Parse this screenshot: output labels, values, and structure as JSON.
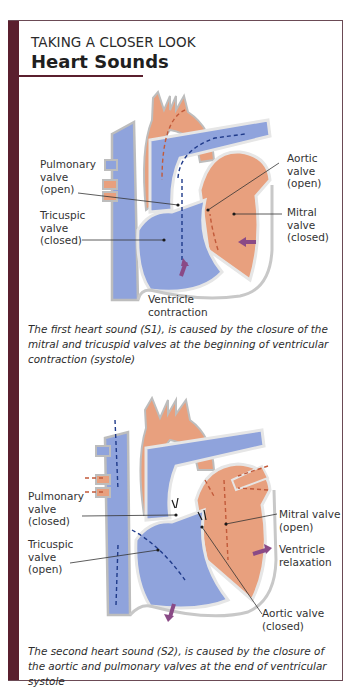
{
  "header": {
    "kicker": "TAKING A CLOSER LOOK",
    "title": "Heart Sounds"
  },
  "colors": {
    "frame_bar": "#5a1f2e",
    "deoxygenated_blood": "#8fa3dc",
    "oxygenated_blood": "#e8a07e",
    "vessel_wall": "#e6e6e6",
    "motion_arrow": "#8a4a86"
  },
  "figure_s1": {
    "labels": {
      "pulmonary_valve": "Pulmonary\nvalve\n(open)",
      "tricuspid_valve": "Tricuspic\nvalve\n(closed)",
      "aortic_valve": "Aortic\nvalve\n(open)",
      "mitral_valve": "Mitral\nvalve\n(closed)",
      "ventricle_motion": "Ventricle\ncontraction"
    },
    "caption": "The first heart sound (S1), is caused by the closure of the mitral and tricuspid valves at the beginning of ventricular contraction (systole)"
  },
  "figure_s2": {
    "labels": {
      "pulmonary_valve": "Pulmonary\nvalve\n(closed)",
      "tricuspid_valve": "Tricuspic\nvalve\n(open)",
      "mitral_valve": "Mitral valve\n(open)",
      "ventricle_motion": "Ventricle\nrelaxation",
      "aortic_valve": "Aortic valve\n(closed)"
    },
    "caption": "The second heart sound (S2), is caused by the closure of the aortic and pulmonary valves at the end of ventricular systole"
  }
}
